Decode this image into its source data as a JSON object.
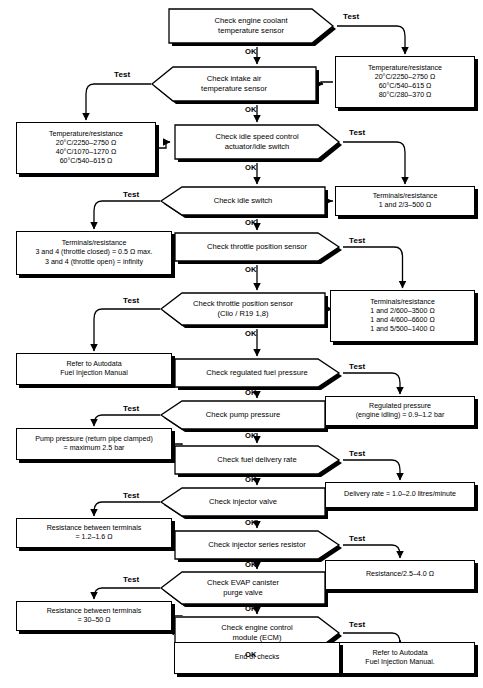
{
  "diagram": {
    "edge_labels": {
      "test": "Test",
      "ok": "OK"
    },
    "colors": {
      "line": "#000000",
      "fill": "#ffffff",
      "shadow": "#000000"
    }
  },
  "steps": [
    {
      "id": "coolant",
      "label": "Check engine coolant\ntemperature sensor",
      "dir": "right",
      "x": 168,
      "y": 8,
      "w": 166,
      "h": 36
    },
    {
      "id": "intake",
      "label": "Check intake air\ntemperature sensor",
      "dir": "left",
      "x": 151,
      "y": 66,
      "w": 166,
      "h": 36
    },
    {
      "id": "idlespeed",
      "label": "Check idle speed control\nactuator/idle switch",
      "dir": "right",
      "x": 174,
      "y": 124,
      "w": 166,
      "h": 36
    },
    {
      "id": "idleswitch",
      "label": "Check idle switch",
      "dir": "left",
      "x": 160,
      "y": 186,
      "w": 166,
      "h": 30
    },
    {
      "id": "tps1",
      "label": "Check throttle position sensor",
      "dir": "right",
      "x": 174,
      "y": 232,
      "w": 166,
      "h": 30
    },
    {
      "id": "tps2",
      "label": "Check throttle position sensor\n(Clio / R19 1,8)",
      "dir": "left",
      "x": 160,
      "y": 292,
      "w": 166,
      "h": 34
    },
    {
      "id": "regfuel",
      "label": "Check regulated fuel pressure",
      "dir": "right",
      "x": 174,
      "y": 358,
      "w": 166,
      "h": 30
    },
    {
      "id": "pump",
      "label": "Check pump pressure",
      "dir": "left",
      "x": 160,
      "y": 400,
      "w": 166,
      "h": 30
    },
    {
      "id": "delivery",
      "label": "Check fuel delivery rate",
      "dir": "right",
      "x": 174,
      "y": 445,
      "w": 166,
      "h": 30
    },
    {
      "id": "injvalve",
      "label": "Check injector valve",
      "dir": "left",
      "x": 160,
      "y": 487,
      "w": 166,
      "h": 30
    },
    {
      "id": "injres",
      "label": "Check injector series resistor",
      "dir": "right",
      "x": 174,
      "y": 530,
      "w": 166,
      "h": 30
    },
    {
      "id": "evap",
      "label": "Check EVAP canister\npurge valve",
      "dir": "left",
      "x": 160,
      "y": 571,
      "w": 166,
      "h": 34
    },
    {
      "id": "ecm",
      "label": "Check engine control\nmodule (ECM)",
      "dir": "right",
      "x": 174,
      "y": 616,
      "w": 166,
      "h": 34
    }
  ],
  "boxes": [
    {
      "id": "b-coolant",
      "label": "Temperature/resistance\n20°C/2250–2750 Ω\n60°C/540–615 Ω\n80°C/280–370 Ω",
      "x": 335,
      "y": 56,
      "w": 140,
      "h": 52
    },
    {
      "id": "b-intake",
      "label": "Temperature/resistance\n20°C/2250–2750 Ω\n40°C/1070–1270 Ω\n60°C/540–615 Ω",
      "x": 16,
      "y": 122,
      "w": 140,
      "h": 52
    },
    {
      "id": "b-idlespd",
      "label": "Terminals/resistance\n1 and 2/3–500 Ω",
      "x": 335,
      "y": 186,
      "w": 140,
      "h": 30
    },
    {
      "id": "b-idlesw",
      "label": "Terminals/resistance\n3 and 4 (throttle closed) = 0.5 Ω max.\n3 and 4 (throttle open) = infinity",
      "x": 16,
      "y": 231,
      "w": 156,
      "h": 44
    },
    {
      "id": "b-tps1",
      "label": "Terminals/resistance\n1 and 2/600–3500 Ω\n1 and 4/600–6600 Ω\n1 and 5/500–1400 Ω",
      "x": 330,
      "y": 290,
      "w": 145,
      "h": 52
    },
    {
      "id": "b-tps2",
      "label": "Refer to Autodata\nFuel Injection Manual",
      "x": 16,
      "y": 353,
      "w": 156,
      "h": 32
    },
    {
      "id": "b-regfuel",
      "label": "Regulated pressure\n(engine idling) = 0.9–1.2 bar",
      "x": 325,
      "y": 396,
      "w": 150,
      "h": 30
    },
    {
      "id": "b-pump",
      "label": "Pump pressure (return pipe clamped)\n= maximum 2.5 bar",
      "x": 16,
      "y": 428,
      "w": 156,
      "h": 32
    },
    {
      "id": "b-delivery",
      "label": "Delivery rate = 1.0–2.0 litres/minute",
      "x": 325,
      "y": 482,
      "w": 150,
      "h": 26
    },
    {
      "id": "b-injvalve",
      "label": "Resistance between terminals\n= 1.2–1.6 Ω",
      "x": 16,
      "y": 518,
      "w": 156,
      "h": 30
    },
    {
      "id": "b-injres",
      "label": "Resistance/2.5–4.0 Ω",
      "x": 325,
      "y": 560,
      "w": 150,
      "h": 30
    },
    {
      "id": "b-evap",
      "label": "Resistance between terminals\n= 30–50 Ω",
      "x": 16,
      "y": 601,
      "w": 156,
      "h": 30
    },
    {
      "id": "b-ecm",
      "label": "Refer to Autodata\nFuel Injection Manual.",
      "x": 325,
      "y": 642,
      "w": 150,
      "h": 32
    },
    {
      "id": "b-end",
      "label": "End of checks",
      "x": 174,
      "y": 642,
      "w": 166,
      "h": 32
    }
  ],
  "test_labels": [
    {
      "for": "coolant",
      "text": "Test",
      "x": 343,
      "y": 12
    },
    {
      "for": "intake",
      "text": "Test",
      "x": 114,
      "y": 70
    },
    {
      "for": "idlespeed",
      "text": "Test",
      "x": 349,
      "y": 128
    },
    {
      "for": "idleswitch",
      "text": "Test",
      "x": 123,
      "y": 190
    },
    {
      "for": "tps1",
      "text": "Test",
      "x": 349,
      "y": 236
    },
    {
      "for": "tps2",
      "text": "Test",
      "x": 123,
      "y": 296
    },
    {
      "for": "regfuel",
      "text": "Test",
      "x": 349,
      "y": 362
    },
    {
      "for": "pump",
      "text": "Test",
      "x": 123,
      "y": 404
    },
    {
      "for": "delivery",
      "text": "Test",
      "x": 349,
      "y": 449
    },
    {
      "for": "injvalve",
      "text": "Test",
      "x": 123,
      "y": 491
    },
    {
      "for": "injres",
      "text": "Test",
      "x": 349,
      "y": 534
    },
    {
      "for": "evap",
      "text": "Test",
      "x": 123,
      "y": 575
    },
    {
      "for": "ecm",
      "text": "Test",
      "x": 349,
      "y": 620
    }
  ],
  "ok_labels": [
    {
      "text": "OK",
      "x": 245,
      "y": 47
    },
    {
      "text": "OK",
      "x": 245,
      "y": 105
    },
    {
      "text": "OK",
      "x": 245,
      "y": 163
    },
    {
      "text": "OK",
      "x": 245,
      "y": 218
    },
    {
      "text": "OK",
      "x": 245,
      "y": 265
    },
    {
      "text": "OK",
      "x": 245,
      "y": 329
    },
    {
      "text": "OK",
      "x": 245,
      "y": 388
    },
    {
      "text": "OK",
      "x": 245,
      "y": 431
    },
    {
      "text": "OK",
      "x": 245,
      "y": 475
    },
    {
      "text": "OK",
      "x": 245,
      "y": 518
    },
    {
      "text": "OK",
      "x": 245,
      "y": 560
    },
    {
      "text": "OK",
      "x": 245,
      "y": 604
    },
    {
      "text": "OK",
      "x": 245,
      "y": 650
    }
  ]
}
